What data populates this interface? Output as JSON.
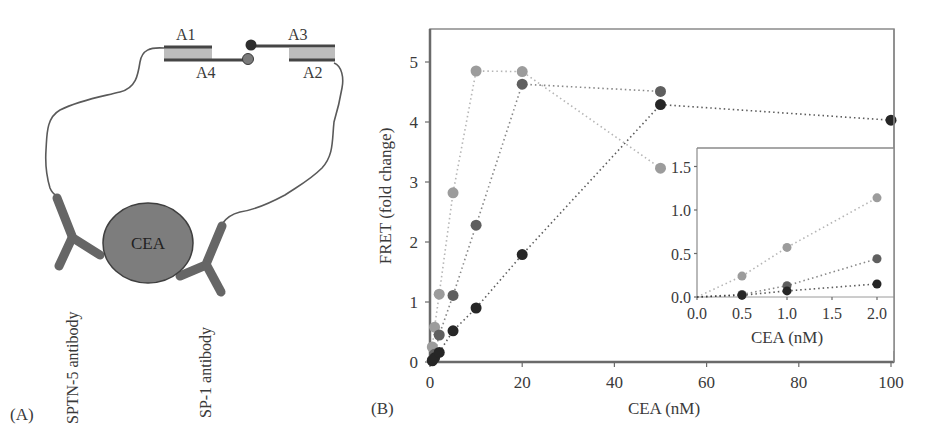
{
  "panel_a": {
    "label": "(A)",
    "strand_labels": {
      "a1": "A1",
      "a2": "A2",
      "a3": "A3",
      "a4": "A4"
    },
    "protein_label": "CEA",
    "antibody_left_label": "SPTN-5 antibody",
    "antibody_right_label": "SP-1 antibody",
    "colors": {
      "protein_fill": "#7d7d7d",
      "antibody": "#666666",
      "strand_fill": "#bdbdbd",
      "strand_line": "#4a4a4a",
      "tether": "#555555"
    }
  },
  "panel_b": {
    "label": "(B)"
  },
  "chart_data": [
    {
      "id": "main",
      "type": "scatter",
      "title": "",
      "xlabel": "CEA (nM)",
      "ylabel": "FRET (fold change)",
      "xlim": [
        0,
        100
      ],
      "ylim": [
        0,
        5.5
      ],
      "xticks": [
        0,
        20,
        40,
        60,
        80,
        100
      ],
      "yticks": [
        0,
        1,
        2,
        3,
        4,
        5
      ],
      "grid": false,
      "legend": null,
      "connected_with": "dotted lines",
      "series": [
        {
          "name": "light",
          "color": "#9c9c9c",
          "x": [
            0,
            0.5,
            1,
            2,
            5,
            10,
            20,
            50
          ],
          "y": [
            0,
            0.25,
            0.58,
            1.13,
            2.82,
            4.85,
            4.84,
            3.23
          ]
        },
        {
          "name": "medium",
          "color": "#5f5f5f",
          "x": [
            0,
            0.5,
            1,
            2,
            5,
            10,
            20,
            50
          ],
          "y": [
            0,
            0.03,
            0.13,
            0.45,
            1.11,
            2.28,
            4.63,
            4.51
          ]
        },
        {
          "name": "dark",
          "color": "#262626",
          "x": [
            0,
            0.5,
            1,
            2,
            5,
            10,
            20,
            50,
            100
          ],
          "y": [
            0,
            0.02,
            0.07,
            0.16,
            0.52,
            0.9,
            1.79,
            4.29,
            4.03
          ]
        }
      ]
    },
    {
      "id": "inset",
      "type": "scatter",
      "title": "",
      "xlabel": "CEA (nM)",
      "ylabel": "",
      "xlim": [
        0,
        2.2
      ],
      "ylim": [
        0,
        1.7
      ],
      "xticks": [
        "0.0",
        "0.5",
        "1.0",
        "1.5",
        "2.0"
      ],
      "yticks": [
        "0.0",
        "0.5",
        "1.0",
        "1.5"
      ],
      "grid": false,
      "connected_with": "dotted lines",
      "series": [
        {
          "name": "light",
          "color": "#9c9c9c",
          "x": [
            0,
            0.5,
            1,
            2
          ],
          "y": [
            0,
            0.24,
            0.57,
            1.14
          ]
        },
        {
          "name": "medium",
          "color": "#5f5f5f",
          "x": [
            0,
            0.5,
            1,
            2
          ],
          "y": [
            0,
            0.03,
            0.13,
            0.44
          ]
        },
        {
          "name": "dark",
          "color": "#262626",
          "x": [
            0,
            0.5,
            1,
            2
          ],
          "y": [
            0,
            0.02,
            0.07,
            0.15
          ]
        }
      ]
    }
  ]
}
